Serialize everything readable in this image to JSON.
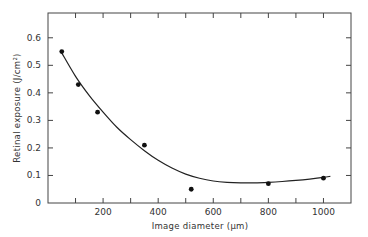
{
  "chart_data": {
    "type": "scatter",
    "title": "",
    "xlabel": "Image diameter (μm)",
    "ylabel": "Retinal exposure (J/cm²)",
    "xlim": [
      0,
      1100
    ],
    "ylim": [
      0,
      0.69
    ],
    "xticks": [
      100,
      200,
      300,
      400,
      500,
      600,
      700,
      800,
      900,
      1000
    ],
    "xtick_labels": [
      {
        "value": 200,
        "label": "200"
      },
      {
        "value": 400,
        "label": "400"
      },
      {
        "value": 600,
        "label": "600"
      },
      {
        "value": 800,
        "label": "800"
      },
      {
        "value": 1000,
        "label": "1000"
      }
    ],
    "yticks": [
      {
        "value": 0,
        "label": "0"
      },
      {
        "value": 0.1,
        "label": "0.1"
      },
      {
        "value": 0.2,
        "label": "0.2"
      },
      {
        "value": 0.3,
        "label": "0.3"
      },
      {
        "value": 0.4,
        "label": "0.4"
      },
      {
        "value": 0.5,
        "label": "0.5"
      },
      {
        "value": 0.6,
        "label": "0.6"
      }
    ],
    "grid": false,
    "legend": null,
    "series": [
      {
        "name": "Measured points",
        "kind": "scatter",
        "x": [
          50,
          110,
          180,
          350,
          520,
          800,
          1000
        ],
        "y": [
          0.55,
          0.43,
          0.33,
          0.21,
          0.05,
          0.07,
          0.09
        ]
      },
      {
        "name": "Fitted curve",
        "kind": "line",
        "x": [
          50,
          100,
          150,
          200,
          250,
          300,
          350,
          400,
          450,
          500,
          550,
          600,
          650,
          700,
          750,
          800,
          850,
          900,
          950,
          1000,
          1025
        ],
        "y": [
          0.545,
          0.46,
          0.39,
          0.33,
          0.275,
          0.23,
          0.19,
          0.155,
          0.127,
          0.105,
          0.09,
          0.08,
          0.075,
          0.073,
          0.073,
          0.075,
          0.078,
          0.082,
          0.087,
          0.093,
          0.097
        ]
      }
    ]
  }
}
